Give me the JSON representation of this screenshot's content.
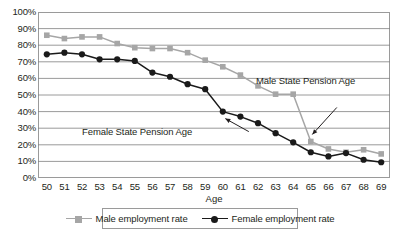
{
  "chart_data": {
    "type": "line",
    "title": "",
    "xlabel": "Age",
    "ylabel": "",
    "grid": "horizontal",
    "legend_position": "bottom",
    "xlim": [
      50,
      69
    ],
    "ylim": [
      0,
      100
    ],
    "y_tick_format": "percent",
    "x": [
      50,
      51,
      52,
      53,
      54,
      55,
      56,
      57,
      58,
      59,
      60,
      61,
      62,
      63,
      64,
      65,
      66,
      67,
      68,
      69
    ],
    "x_tick_labels": [
      "50",
      "51",
      "52",
      "53",
      "54",
      "55",
      "56",
      "57",
      "58",
      "59",
      "60",
      "61",
      "62",
      "63",
      "64",
      "65",
      "66",
      "67",
      "68",
      "69"
    ],
    "y_tick_labels": [
      "100%",
      "90%",
      "80%",
      "70%",
      "60%",
      "50%",
      "40%",
      "30%",
      "20%",
      "10%",
      "0%"
    ],
    "y_tick_values": [
      100,
      90,
      80,
      70,
      60,
      50,
      40,
      30,
      20,
      10,
      0
    ],
    "series": [
      {
        "name": "Male employment rate",
        "color": "#a6a6a6",
        "marker": "square",
        "values": [
          86,
          84,
          85,
          85,
          81,
          78.5,
          78,
          78,
          75.5,
          71,
          67,
          62,
          55.5,
          50.5,
          50.5,
          22,
          17.5,
          15.5,
          17,
          14.5
        ]
      },
      {
        "name": "Female employment rate",
        "color": "#1a1a1a",
        "marker": "circle",
        "values": [
          74.5,
          75.5,
          74.5,
          71.5,
          71.5,
          70.5,
          63.5,
          61,
          56.5,
          53.5,
          40,
          37,
          33,
          27,
          21.5,
          15.5,
          13,
          15,
          11,
          9.5
        ]
      }
    ],
    "annotations": [
      {
        "text": "Female State Pension Age",
        "target_x": 60,
        "target_y": 40
      },
      {
        "text": "Male State Pension Age",
        "target_x": 65,
        "target_y": 22
      }
    ]
  },
  "legend": {
    "entries": [
      {
        "label": "Male employment rate"
      },
      {
        "label": "Female employment rate"
      }
    ]
  },
  "axes": {
    "x_title": "Age"
  },
  "colors": {
    "male_series": "#a6a6a6",
    "female_series": "#1a1a1a",
    "gridline": "#808080",
    "frame": "#9a9a9a",
    "text": "#231f20",
    "background": "#ffffff"
  }
}
